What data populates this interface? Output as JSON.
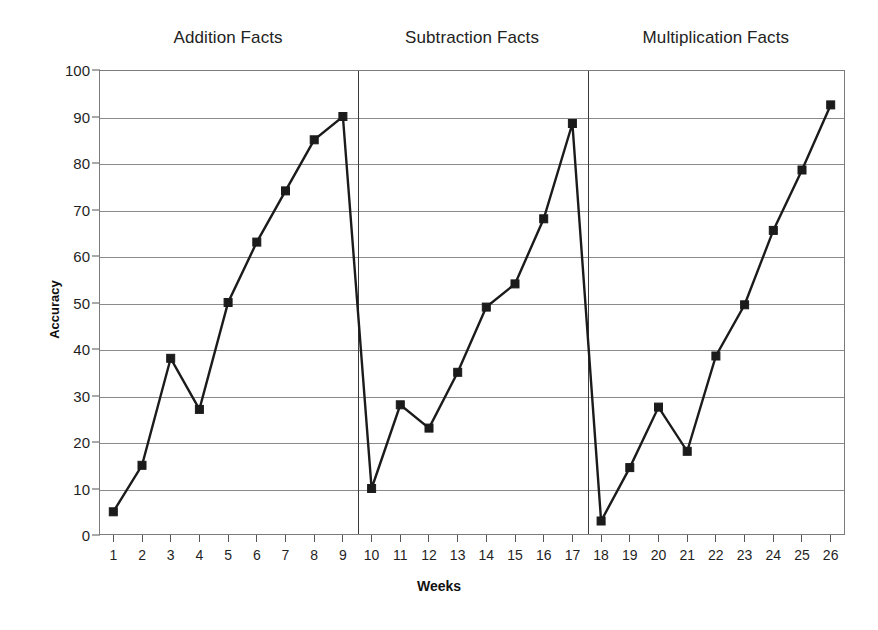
{
  "chart_data": {
    "type": "line",
    "title": "",
    "xlabel": "Weeks",
    "ylabel": "Accuracy",
    "xlim": [
      0.5,
      26.5
    ],
    "ylim": [
      0,
      100
    ],
    "ytick_step": 10,
    "grid": true,
    "legend": "none",
    "x": [
      1,
      2,
      3,
      4,
      5,
      6,
      7,
      8,
      9,
      10,
      11,
      12,
      13,
      14,
      15,
      16,
      17,
      18,
      19,
      20,
      21,
      22,
      23,
      24,
      25,
      26
    ],
    "categories": [
      "1",
      "2",
      "3",
      "4",
      "5",
      "6",
      "7",
      "8",
      "9",
      "10",
      "11",
      "12",
      "13",
      "14",
      "15",
      "16",
      "17",
      "18",
      "19",
      "20",
      "21",
      "22",
      "23",
      "24",
      "25",
      "26"
    ],
    "yticks": [
      "0",
      "10",
      "20",
      "30",
      "40",
      "50",
      "60",
      "70",
      "80",
      "90",
      "100"
    ],
    "series": [
      {
        "name": "Accuracy",
        "values": [
          5,
          15,
          38,
          27,
          50,
          63,
          74,
          85,
          90,
          10,
          28,
          23,
          35,
          49,
          54,
          68,
          88.5,
          3,
          14.5,
          27.5,
          18,
          38.5,
          49.5,
          65.5,
          78.5,
          92.5
        ],
        "marker": "filled-square",
        "color": "#1b1b1b",
        "breaks": [
          9,
          17
        ]
      }
    ],
    "phases": [
      {
        "label": "Addition Facts",
        "start_week": 1,
        "end_week": 9,
        "center_week": 5
      },
      {
        "label": "Subtraction Facts",
        "start_week": 10,
        "end_week": 17,
        "center_week": 13.5
      },
      {
        "label": "Multiplication Facts",
        "start_week": 18,
        "end_week": 26,
        "center_week": 22
      },
      {
        "label": "",
        "start_week": 0,
        "end_week": 0,
        "center_week": 0
      }
    ],
    "phase_separators": [
      9.5,
      17.5
    ],
    "annotations": []
  }
}
